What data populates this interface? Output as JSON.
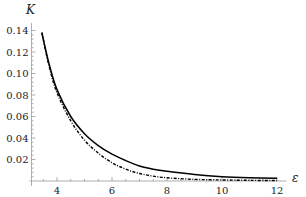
{
  "chart_data": {
    "type": "line",
    "title": "",
    "xlabel": "ε",
    "ylabel": "K",
    "xlim": [
      3,
      12.2
    ],
    "ylim": [
      0,
      0.145
    ],
    "grid": false,
    "legend": "none",
    "x_ticks": [
      4,
      6,
      8,
      10,
      12
    ],
    "x_tick_labels": [
      "4",
      "6",
      "8",
      "10",
      "12"
    ],
    "y_ticks": [
      0.02,
      0.04,
      0.06,
      0.08,
      0.1,
      0.12,
      0.14
    ],
    "y_tick_labels": [
      "0.02",
      "0.04",
      "0.06",
      "0.08",
      "0.10",
      "0.12",
      "0.14"
    ],
    "series": [
      {
        "name": "solid",
        "style": "solid",
        "color": "#000000",
        "x": [
          3.45,
          3.7,
          4,
          4.5,
          5,
          5.5,
          6,
          6.5,
          7,
          7.5,
          8,
          9,
          10,
          11,
          12
        ],
        "values": [
          0.138,
          0.11,
          0.085,
          0.06,
          0.044,
          0.033,
          0.025,
          0.019,
          0.014,
          0.011,
          0.009,
          0.006,
          0.004,
          0.003,
          0.0025
        ]
      },
      {
        "name": "dashed",
        "style": "dash-dot",
        "color": "#000000",
        "x": [
          3.45,
          3.7,
          4,
          4.5,
          5,
          5.5,
          6,
          6.5,
          7,
          7.5,
          8,
          9,
          10,
          11,
          12
        ],
        "values": [
          0.138,
          0.108,
          0.082,
          0.056,
          0.038,
          0.026,
          0.017,
          0.011,
          0.007,
          0.0045,
          0.003,
          0.0015,
          0.001,
          0.0006,
          0.0004
        ]
      }
    ]
  }
}
